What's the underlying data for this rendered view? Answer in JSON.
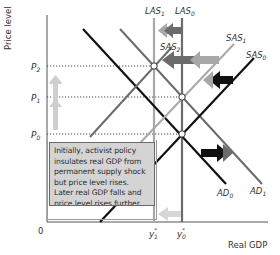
{
  "axes": {
    "y_label": "Price level",
    "x_label": "Real GDP",
    "origin": "0"
  },
  "y_ticks": [
    {
      "label": "P",
      "sub": "2",
      "y": 66
    },
    {
      "label": "P",
      "sub": "1",
      "y": 97
    },
    {
      "label": "P",
      "sub": "0",
      "y": 134
    }
  ],
  "x_ticks": [
    {
      "label": "y",
      "sup": "*",
      "sub": "1",
      "x": 154
    },
    {
      "label": "y",
      "sup": "*",
      "sub": "0",
      "x": 182
    }
  ],
  "curves": {
    "las1": {
      "label": "LAS",
      "sub": "1",
      "color": "#a8a8a8"
    },
    "las0": {
      "label": "LAS",
      "sub": "0",
      "color": "#6b6b6b"
    },
    "sas2": {
      "label": "SAS",
      "sub": "2",
      "color": "#6b6b6b"
    },
    "sas1": {
      "label": "SAS",
      "sub": "1",
      "color": "#a8a8a8"
    },
    "sas0": {
      "label": "SAS",
      "sub": "0",
      "color": "#111111"
    },
    "ad0": {
      "label": "AD",
      "sub": "0",
      "color": "#111111"
    },
    "ad1": {
      "label": "AD",
      "sub": "1",
      "color": "#6b6b6b"
    }
  },
  "annotation": {
    "lines": [
      "Initially, activist policy",
      "insulates real GDP from",
      "permanent supply shock",
      "but price level rises.",
      "Later real GDP falls and",
      "price level rises further"
    ]
  },
  "colors": {
    "black": "#111111",
    "dark_gray": "#6b6b6b",
    "light_gray": "#a8a8a8",
    "pale_gray": "#cfcfcf",
    "box_fill": "#d4d4d4"
  }
}
